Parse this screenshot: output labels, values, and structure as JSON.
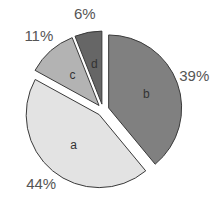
{
  "chart_data": {
    "type": "pie",
    "title": "",
    "exploded": true,
    "slices": [
      {
        "label": "b",
        "value": 39,
        "pct_label": "39%",
        "color": "#808080"
      },
      {
        "label": "a",
        "value": 44,
        "pct_label": "44%",
        "color": "#e3e3e3"
      },
      {
        "label": "c",
        "value": 11,
        "pct_label": "11%",
        "color": "#b3b3b3"
      },
      {
        "label": "d",
        "value": 6,
        "pct_label": "6%",
        "color": "#666666"
      }
    ],
    "start_angle": "top, clockwise"
  }
}
